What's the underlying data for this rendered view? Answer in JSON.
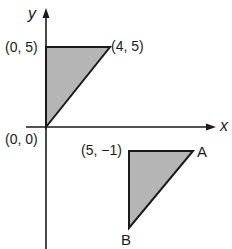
{
  "axes": {
    "x_label": "x",
    "y_label": "y",
    "origin_label": "(0, 0)"
  },
  "triangle_1": {
    "vertices": [
      [
        0,
        0
      ],
      [
        0,
        5
      ],
      [
        4,
        5
      ]
    ],
    "labels": {
      "top_left": "(0, 5)",
      "top_right": "(4, 5)"
    },
    "fill": "#b5b5b5"
  },
  "triangle_2": {
    "vertices": [
      [
        5,
        -1
      ],
      [
        9,
        -1
      ],
      [
        5,
        -6
      ]
    ],
    "labels": {
      "top_left": "(5, −1)",
      "a": "A",
      "b": "B"
    },
    "fill": "#b5b5b5"
  },
  "colors": {
    "stroke": "#1a1a1a",
    "fill": "#b5b5b5",
    "background": "#ffffff"
  }
}
